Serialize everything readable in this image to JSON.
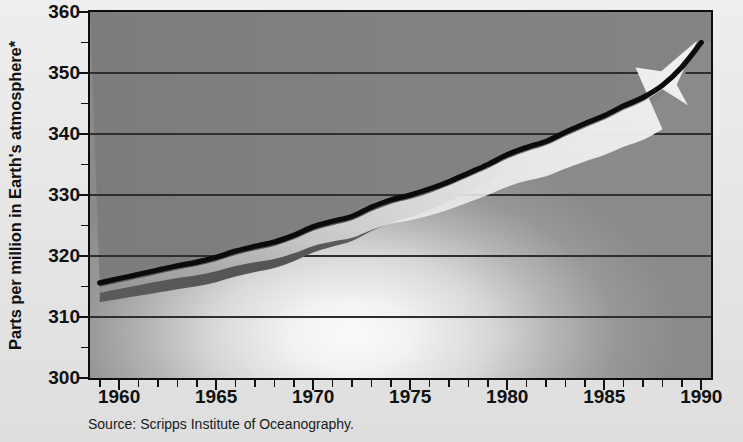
{
  "chart_data": {
    "type": "line",
    "title": "",
    "subtitle": "",
    "xlabel": "",
    "ylabel": "Parts per million in Earth's atmosphere*",
    "source": "Source: Scripps Institute of Oceanography.",
    "xlim": [
      1958.5,
      1990.5
    ],
    "ylim": [
      300,
      360
    ],
    "grid": true,
    "legend": "none",
    "y_ticks": [
      300,
      310,
      320,
      330,
      340,
      350,
      360
    ],
    "y_tick_labels": [
      "300",
      "310",
      "320",
      "330",
      "340",
      "350",
      "360"
    ],
    "x_ticks": [
      1960,
      1965,
      1970,
      1975,
      1980,
      1985,
      1990
    ],
    "x_tick_labels": [
      "1960",
      "1965",
      "1970",
      "1975",
      "1980",
      "1985",
      "1990"
    ],
    "x_minor_ticks": [
      1959,
      1961,
      1962,
      1963,
      1964,
      1966,
      1967,
      1968,
      1969,
      1971,
      1972,
      1973,
      1974,
      1976,
      1977,
      1978,
      1979,
      1981,
      1982,
      1983,
      1984,
      1986,
      1987,
      1988,
      1989,
      1990
    ],
    "y_minor_ticks": [
      305,
      315,
      325,
      335,
      345,
      355
    ],
    "series": [
      {
        "name": "Atmospheric carbon dioxide concentration",
        "x": [
          1959,
          1960,
          1961,
          1962,
          1963,
          1964,
          1965,
          1966,
          1967,
          1968,
          1969,
          1970,
          1971,
          1972,
          1973,
          1974,
          1975,
          1976,
          1977,
          1978,
          1979,
          1980,
          1981,
          1982,
          1983,
          1984,
          1985,
          1986,
          1987,
          1988,
          1989,
          1990
        ],
        "values": [
          315.6,
          316.3,
          317.0,
          317.7,
          318.4,
          319.0,
          319.8,
          320.8,
          321.6,
          322.3,
          323.4,
          324.8,
          325.7,
          326.5,
          328.0,
          329.2,
          330.0,
          331.0,
          332.2,
          333.6,
          335.0,
          336.6,
          337.8,
          338.8,
          340.3,
          341.7,
          343.0,
          344.6,
          346.0,
          348.0,
          351.0,
          355.0
        ]
      }
    ],
    "annotations": [
      {
        "name": "growth-arrow",
        "description": "White tapering arrow overlaying the curve, pointing up and to the right toward 1990",
        "tip_x": 1990,
        "tip_y": 354
      }
    ],
    "colors": {
      "line": "#0b0b0b",
      "shadow_band": "#4a4a4a",
      "arrow_fill": "#ededed",
      "plot_upper_bg": "#7e7e7e",
      "plot_lower_bg": "#f7f7f7",
      "grid": "#2b2b2b",
      "frame": "#0d0d0d",
      "page_bg": "#e8e8e8",
      "text": "#111111"
    }
  },
  "footnote": {
    "source_text": "Source: Scripps Institute of Oceanography."
  }
}
